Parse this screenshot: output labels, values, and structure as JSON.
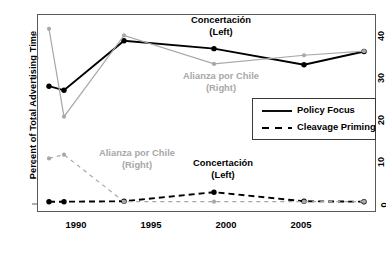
{
  "chart_data": {
    "type": "line",
    "title": "",
    "subtitle": "",
    "xlabel": "",
    "ylabel": "Percent of Total Advertising Time",
    "x": [
      1988,
      1989,
      1993,
      1999,
      2005,
      2009
    ],
    "xlim": [
      1987.2,
      2009.8
    ],
    "ylim": [
      -2.5,
      45.5
    ],
    "xticks": [
      1990,
      1995,
      2000,
      2005
    ],
    "xticklabels": [
      "1990",
      "1995",
      "2000",
      "2005"
    ],
    "yticks": [
      0,
      10,
      20,
      30,
      40
    ],
    "yticklabels": [
      "0",
      "10",
      "20",
      "30",
      "40"
    ],
    "grid": false,
    "legend_position": "center-right",
    "series": [
      {
        "name": "Concertación (Left) — Policy Focus",
        "party": "Concertación (Left)",
        "measure": "Policy Focus",
        "color": "#000000",
        "style": "solid",
        "values": [
          28.0,
          27.0,
          39.0,
          37.1,
          33.2,
          36.4
        ]
      },
      {
        "name": "Alianza por Chile (Right) — Policy Focus",
        "party": "Alianza por Chile (Right)",
        "measure": "Policy Focus",
        "color": "#a8a8a8",
        "style": "solid",
        "values": [
          41.9,
          20.6,
          40.3,
          33.4,
          35.5,
          36.5
        ]
      },
      {
        "name": "Concertación (Left) — Cleavage Priming",
        "party": "Concertación (Left)",
        "measure": "Cleavage Priming",
        "color": "#000000",
        "style": "dashed",
        "values": [
          0.0,
          0.0,
          0.1,
          2.3,
          0.1,
          0.0
        ]
      },
      {
        "name": "Alianza por Chile (Right) — Cleavage Priming",
        "party": "Alianza por Chile (Right)",
        "measure": "Cleavage Priming",
        "color": "#a8a8a8",
        "style": "dashed",
        "values": [
          10.5,
          11.4,
          0.0,
          0.0,
          0.0,
          0.0
        ]
      }
    ],
    "legend": [
      {
        "label": "Policy Focus",
        "style": "solid"
      },
      {
        "label": "Cleavage Priming",
        "style": "dashed"
      }
    ],
    "annotations": [
      {
        "id": "ann-top-left-party",
        "line1": "Concertación",
        "line2": "(Left)",
        "color": "#000000"
      },
      {
        "id": "ann-top-right-party",
        "line1": "Alianza por Chile",
        "line2": "(Right)",
        "color": "#a8a8a8"
      },
      {
        "id": "ann-bottom-right-party",
        "line1": "Alianza por Chile",
        "line2": "(Right)",
        "color": "#a8a8a8"
      },
      {
        "id": "ann-bottom-left-party",
        "line1": "Concertación",
        "line2": "(Left)",
        "color": "#000000"
      }
    ]
  },
  "axes": {
    "ylabel": "Percent of Total Advertising Time",
    "yticklabels": [
      "40",
      "30",
      "20",
      "10",
      "0"
    ],
    "xticklabels": [
      "1990",
      "1995",
      "2000",
      "2005"
    ]
  },
  "legend": {
    "items": [
      {
        "label": "Policy Focus"
      },
      {
        "label": "Cleavage Priming"
      }
    ]
  },
  "annotations": {
    "top_left": {
      "line1": "Concertación",
      "line2": "(Left)"
    },
    "top_right": {
      "line1": "Alianza por Chile",
      "line2": "(Right)"
    },
    "bottom_left": {
      "line1": "Alianza por Chile",
      "line2": "(Right)"
    },
    "bottom_right": {
      "line1": "Concertación",
      "line2": "(Left)"
    }
  },
  "colors": {
    "left_party": "#000000",
    "right_party": "#a8a8a8",
    "axis": "#5a5a5a"
  }
}
